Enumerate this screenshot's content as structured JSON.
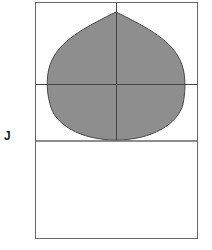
{
  "figure": {
    "label": "J",
    "colors": {
      "background": "#ffffff",
      "grid_line": "#555555",
      "frame_line": "#666666",
      "shape_fill": "#8e8e8e",
      "shape_outline": "#4a4a4a"
    },
    "upper_panel": {
      "description": "square panel divided into four quadrants by a vertical and horizontal center line, containing a shaded teardrop shape",
      "quadrants": 4
    },
    "shape": {
      "type": "teardrop",
      "orientation": "point-up",
      "fill": "shaded-gray"
    },
    "lower_panel": {
      "description": "empty rectangle"
    }
  }
}
